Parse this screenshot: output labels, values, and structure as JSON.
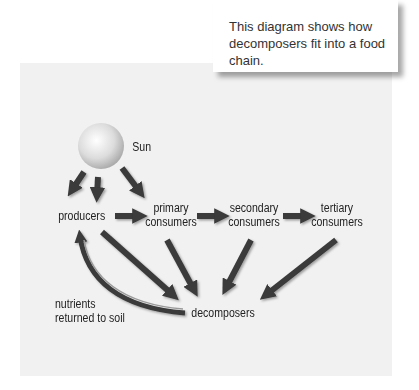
{
  "callout": {
    "text": "This diagram shows how decomposers fit into a food chain."
  },
  "nodes": {
    "sun": "Sun",
    "producers": "producers",
    "primary_line1": "primary",
    "primary_line2": "consumers",
    "secondary_line1": "secondary",
    "secondary_line2": "consumers",
    "tertiary_line1": "tertiary",
    "tertiary_line2": "consumers",
    "decomposers": "decomposers",
    "nutrients_line1": "nutrients",
    "nutrients_line2": "returned to soil"
  },
  "colors": {
    "panel": "#f1f1f1",
    "arrow": "#3a3a3a",
    "text": "#222222"
  },
  "edges": [
    {
      "from": "sun",
      "to": "producers"
    },
    {
      "from": "producers",
      "to": "primary consumers"
    },
    {
      "from": "primary consumers",
      "to": "secondary consumers"
    },
    {
      "from": "secondary consumers",
      "to": "tertiary consumers"
    },
    {
      "from": "producers",
      "to": "decomposers"
    },
    {
      "from": "primary consumers",
      "to": "decomposers"
    },
    {
      "from": "secondary consumers",
      "to": "decomposers"
    },
    {
      "from": "tertiary consumers",
      "to": "decomposers"
    },
    {
      "from": "decomposers",
      "to": "producers",
      "label": "nutrients returned to soil"
    }
  ]
}
